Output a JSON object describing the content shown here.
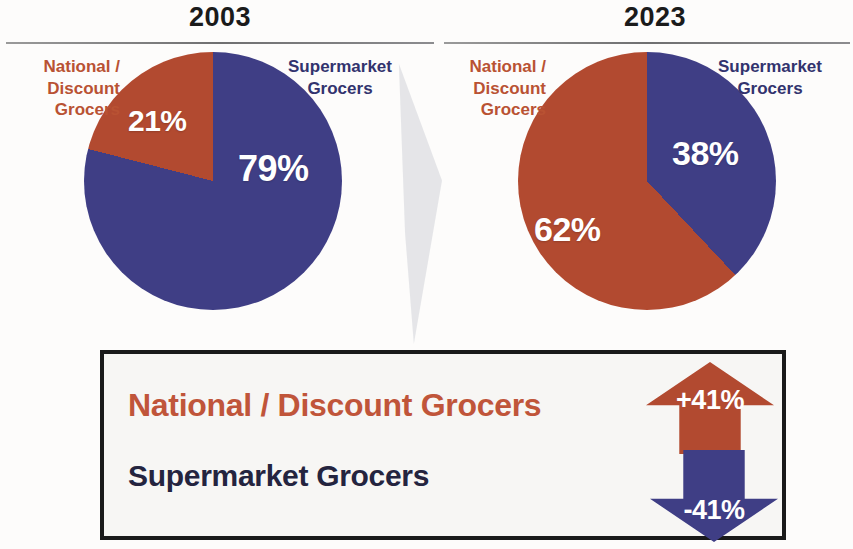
{
  "panels": [
    {
      "year": "2003",
      "labels": {
        "national": "National /\nDiscount\nGrocers",
        "supermarket": "Supermarket\nGrocers"
      },
      "values": {
        "national": "21%",
        "supermarket": "79%"
      }
    },
    {
      "year": "2023",
      "labels": {
        "national": "National /\nDiscount\nGrocers",
        "supermarket": "Supermarket\nGrocers"
      },
      "values": {
        "national": "62%",
        "supermarket": "38%"
      }
    }
  ],
  "legend": {
    "national_label": "National / Discount Grocers",
    "supermarket_label": "Supermarket Grocers",
    "national_change": "+41%",
    "supermarket_change": "-41%"
  },
  "colors": {
    "national": "#b24a30",
    "supermarket": "#3f3e85",
    "national_text": "#b95233",
    "supermarket_text": "#32336e",
    "legend_national_text": "#c0553a",
    "legend_supermarket_text": "#24243f",
    "box_border": "#1a1a1a",
    "divider": "#dcdde2"
  },
  "chart_data": [
    {
      "type": "pie",
      "title": "2003",
      "categories": [
        "Supermarket Grocers",
        "National / Discount Grocers"
      ],
      "values": [
        79,
        21
      ],
      "value_labels": [
        "79%",
        "21%"
      ],
      "colors": [
        "#3f3e85",
        "#b24a30"
      ],
      "units": "percent",
      "legend": "labels placed outside slices",
      "start_angle_deg": 0,
      "direction": "clockwise"
    },
    {
      "type": "pie",
      "title": "2023",
      "categories": [
        "Supermarket Grocers",
        "National / Discount Grocers"
      ],
      "values": [
        38,
        62
      ],
      "value_labels": [
        "38%",
        "62%"
      ],
      "colors": [
        "#3f3e85",
        "#b24a30"
      ],
      "units": "percent",
      "legend": "labels placed outside slices",
      "start_angle_deg": 0,
      "direction": "clockwise"
    },
    {
      "type": "bar",
      "title": "Change 2003 to 2023 (percentage points)",
      "categories": [
        "National / Discount Grocers",
        "Supermarket Grocers"
      ],
      "values": [
        41,
        -41
      ],
      "value_labels": [
        "+41%",
        "-41%"
      ],
      "colors": [
        "#b24a30",
        "#3f3e85"
      ],
      "units": "percent",
      "ylabel": "",
      "xlabel": ""
    }
  ]
}
